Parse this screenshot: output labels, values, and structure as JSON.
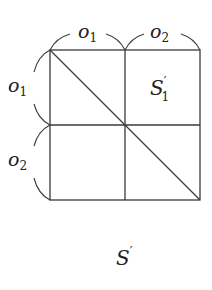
{
  "diagram": {
    "colors": {
      "line": "#3a3a3a",
      "text": "#222222",
      "background": "#ffffff"
    },
    "grid": {
      "rows": 2,
      "cols": 2,
      "x": [
        50,
        125,
        200
      ],
      "y": [
        50,
        125,
        200
      ]
    },
    "diagonal": {
      "from": "top-left",
      "to": "bottom-right"
    },
    "top_labels": [
      {
        "base": "o",
        "sub": "1"
      },
      {
        "base": "o",
        "sub": "2"
      }
    ],
    "left_labels": [
      {
        "base": "o",
        "sub": "1"
      },
      {
        "base": "o",
        "sub": "2"
      }
    ],
    "cell_label": {
      "base": "S",
      "prime": "′",
      "sub": "1",
      "cell": "top-right"
    },
    "caption": {
      "base": "S",
      "prime": "′"
    }
  }
}
